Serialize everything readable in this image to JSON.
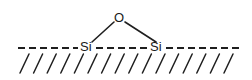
{
  "figure": {
    "background_color": "#ffffff",
    "stroke_color": "#1f1f1f",
    "width": 252,
    "height": 80,
    "atoms": [
      {
        "name": "oxygen",
        "label": "O",
        "x": 119,
        "y": 17,
        "anchor": "middle"
      },
      {
        "name": "silicon-left",
        "label": "Si",
        "x": 80,
        "y": 51,
        "anchor": "start"
      },
      {
        "name": "silicon-right",
        "label": "Si",
        "x": 150,
        "y": 51,
        "anchor": "start"
      }
    ],
    "bonds": [
      {
        "name": "bond-o-si-left",
        "x1": 114,
        "y1": 22,
        "x2": 92,
        "y2": 42
      },
      {
        "name": "bond-o-si-right",
        "x1": 125,
        "y1": 22,
        "x2": 156,
        "y2": 42
      }
    ],
    "surface": {
      "name": "surface-dashed-line",
      "y": 48,
      "x_start": 18,
      "x_end": 242,
      "dash_pattern": "7,4",
      "gap_segments": [
        {
          "x_start": 18,
          "x_end": 78
        },
        {
          "x_start": 96,
          "x_end": 148
        },
        {
          "x_start": 166,
          "x_end": 242
        }
      ]
    },
    "hatching": {
      "name": "surface-hatching",
      "count": 16,
      "x_start": 20,
      "spacing": 13.6,
      "top_y": 54,
      "bottom_y": 73,
      "slant_dx": 9
    }
  }
}
